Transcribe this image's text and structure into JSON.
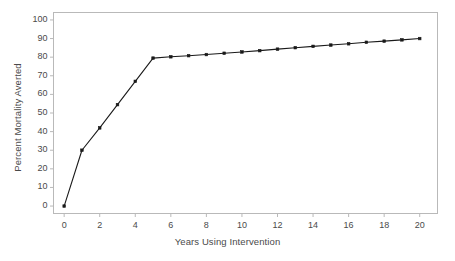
{
  "chart_data": {
    "type": "line",
    "title": "",
    "xlabel": "Years Using Intervention",
    "ylabel": "Percent Mortality Averted",
    "x": [
      0,
      1,
      2,
      3,
      4,
      5,
      6,
      7,
      8,
      9,
      10,
      11,
      12,
      13,
      14,
      15,
      16,
      17,
      18,
      19,
      20
    ],
    "values": [
      0,
      30,
      42,
      54.5,
      67,
      79.5,
      80.2,
      80.8,
      81.4,
      82.1,
      82.8,
      83.5,
      84.3,
      85.1,
      85.8,
      86.5,
      87.2,
      88,
      88.6,
      89.3,
      90
    ],
    "series": [
      {
        "name": "Percent Mortality Averted",
        "values": [
          0,
          30,
          42,
          54.5,
          67,
          79.5,
          80.2,
          80.8,
          81.4,
          82.1,
          82.8,
          83.5,
          84.3,
          85.1,
          85.8,
          86.5,
          87.2,
          88,
          88.6,
          89.3,
          90
        ]
      }
    ],
    "xlim": [
      -0.6,
      21.0
    ],
    "ylim": [
      -4,
      104
    ],
    "xticks": [
      0,
      2,
      4,
      6,
      8,
      10,
      12,
      14,
      16,
      18,
      20
    ],
    "xtick_labels": [
      "0",
      "2",
      "4",
      "6",
      "8",
      "10",
      "12",
      "14",
      "16",
      "18",
      "20"
    ],
    "yticks": [
      0,
      10,
      20,
      30,
      40,
      50,
      60,
      70,
      80,
      90,
      100
    ],
    "ytick_labels": [
      "0",
      "10",
      "20",
      "30",
      "40",
      "50",
      "60",
      "70",
      "80",
      "90",
      "100"
    ],
    "grid": false,
    "legend": false,
    "marker": "square",
    "line_color": "#1a1a1a",
    "marker_color": "#1a1a1a",
    "frame_color": "#b9b9b9",
    "background": "#ffffff"
  }
}
